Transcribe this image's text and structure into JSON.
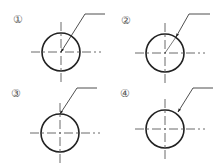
{
  "diagram": {
    "colors": {
      "line": "#222222",
      "centerline": "#444444",
      "label": "#555555",
      "background": "#ffffff"
    },
    "panels": [
      {
        "id": "1",
        "label": "①",
        "label_pos": [
          18,
          19
        ],
        "circle": {
          "cx": 61,
          "cy": 52,
          "r": 19
        },
        "leader": {
          "shelf": [
            [
              85,
              14
            ],
            [
              105,
              14
            ]
          ],
          "line_from": [
            85,
            14
          ],
          "arrow_tip": [
            61,
            52
          ]
        },
        "arrow_target": "center"
      },
      {
        "id": "2",
        "label": "②",
        "label_pos": [
          126,
          20
        ],
        "circle": {
          "cx": 165,
          "cy": 53,
          "r": 19
        },
        "leader": {
          "shelf": [
            [
              189,
              14
            ],
            [
              210,
              14
            ]
          ],
          "line_from": [
            189,
            14
          ],
          "arrow_tip": [
            176,
            37
          ]
        },
        "arrow_target": "circumference-toward-center",
        "extension_to_center": true
      },
      {
        "id": "3",
        "label": "③",
        "label_pos": [
          16,
          93
        ],
        "circle": {
          "cx": 60,
          "cy": 133,
          "r": 19
        },
        "leader": {
          "shelf": [
            [
              77,
              88
            ],
            [
              97,
              88
            ]
          ],
          "line_from": [
            77,
            88
          ],
          "arrow_tip": [
            60,
            114
          ]
        },
        "arrow_target": "circumference-at-centerline"
      },
      {
        "id": "4",
        "label": "④",
        "label_pos": [
          125,
          93
        ],
        "circle": {
          "cx": 165,
          "cy": 129,
          "r": 19
        },
        "leader": {
          "shelf": [
            [
              193,
              88
            ],
            [
              213,
              88
            ]
          ],
          "line_from": [
            193,
            88
          ],
          "arrow_tip": [
            178,
            112
          ]
        },
        "arrow_target": "circumference"
      }
    ]
  }
}
